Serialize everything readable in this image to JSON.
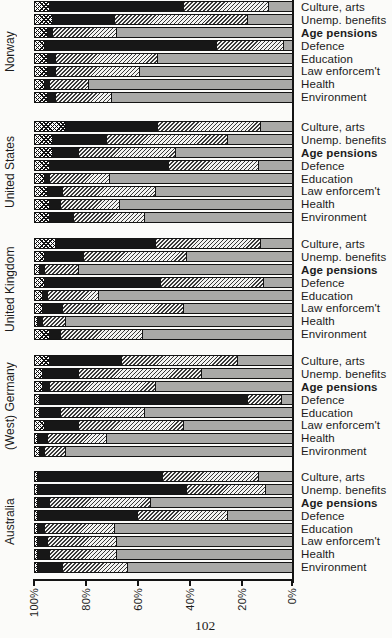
{
  "page": {
    "number": "102"
  },
  "axis": {
    "tick_labels": [
      "100%",
      "80%",
      "60%",
      "40%",
      "20%",
      "0%"
    ],
    "tick_x": [
      34,
      86,
      138,
      190,
      242,
      292
    ]
  },
  "categories": [
    "Culture, arts",
    "Unemp. benefits",
    "Age pensions",
    "Defence",
    "Education",
    "Law enforcem't",
    "Health",
    "Environment"
  ],
  "bold_category_index": 2,
  "colors": {
    "bar_black": "#171717",
    "bar_gray": "#a9a9a7",
    "pattern_ink": "#111111",
    "page_background": "#fbfbf9"
  },
  "chart_data": {
    "type": "bar",
    "variant": "horizontal-100%-stacked",
    "axis_reversed": true,
    "x_tick_labels": [
      "100%",
      "80%",
      "60%",
      "40%",
      "20%",
      "0%"
    ],
    "xlim": [
      100,
      0
    ],
    "grid": false,
    "legend": "none visible",
    "segment_patterns": [
      "crosshatch",
      "solid-black",
      "diagonal-hatch",
      "solid-gray"
    ],
    "categories": [
      "Culture, arts",
      "Unemp. benefits",
      "Age pensions",
      "Defence",
      "Education",
      "Law enforcem't",
      "Health",
      "Environment"
    ],
    "panels": [
      {
        "country": "Norway",
        "rows": [
          [
            6,
            52,
            33,
            9
          ],
          [
            7,
            24,
            52,
            17
          ],
          [
            5,
            2,
            25,
            68
          ],
          [
            4,
            67,
            26,
            3
          ],
          [
            5,
            3,
            40,
            52
          ],
          [
            5,
            3,
            33,
            59
          ],
          [
            4,
            2,
            15,
            79
          ],
          [
            5,
            3,
            22,
            70
          ]
        ]
      },
      {
        "country": "United States",
        "rows": [
          [
            12,
            36,
            40,
            12
          ],
          [
            7,
            21,
            47,
            25
          ],
          [
            7,
            10,
            38,
            45
          ],
          [
            6,
            46,
            35,
            13
          ],
          [
            4,
            2,
            23,
            71
          ],
          [
            5,
            6,
            36,
            53
          ],
          [
            6,
            4,
            23,
            67
          ],
          [
            6,
            9,
            28,
            57
          ]
        ]
      },
      {
        "country": "United Kingdom",
        "rows": [
          [
            8,
            39,
            41,
            12
          ],
          [
            4,
            15,
            40,
            41
          ],
          [
            2,
            2,
            13,
            83
          ],
          [
            4,
            45,
            40,
            11
          ],
          [
            3,
            2,
            20,
            75
          ],
          [
            3,
            8,
            47,
            42
          ],
          [
            1,
            2,
            9,
            88
          ],
          [
            6,
            4,
            32,
            58
          ]
        ]
      },
      {
        "country": "(West) Germany",
        "rows": [
          [
            6,
            28,
            45,
            21
          ],
          [
            3,
            14,
            48,
            35
          ],
          [
            3,
            3,
            41,
            53
          ],
          [
            2,
            81,
            13,
            4
          ],
          [
            2,
            8,
            33,
            57
          ],
          [
            4,
            13,
            41,
            42
          ],
          [
            1,
            4,
            23,
            72
          ],
          [
            2,
            2,
            8,
            88
          ]
        ]
      },
      {
        "country": "Australia",
        "rows": [
          [
            1,
            49,
            37,
            13
          ],
          [
            1,
            58,
            31,
            10
          ],
          [
            1,
            5,
            39,
            55
          ],
          [
            1,
            39,
            35,
            25
          ],
          [
            1,
            3,
            27,
            69
          ],
          [
            1,
            4,
            27,
            68
          ],
          [
            1,
            5,
            26,
            68
          ],
          [
            1,
            10,
            25,
            64
          ]
        ]
      }
    ],
    "panel_tops": [
      1,
      121,
      238,
      355,
      471
    ]
  }
}
